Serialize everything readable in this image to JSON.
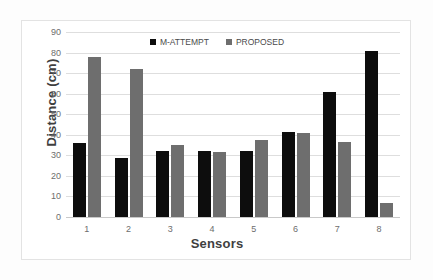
{
  "chart_data": {
    "type": "bar",
    "title": "",
    "xlabel": "Sensors",
    "ylabel": "Distance (cm)",
    "categories": [
      "1",
      "2",
      "3",
      "4",
      "5",
      "6",
      "7",
      "8"
    ],
    "series": [
      {
        "name": "M-ATTEMPT",
        "color": "#0d0d0d",
        "values": [
          36,
          28.5,
          32,
          32,
          32,
          41.5,
          61,
          81
        ]
      },
      {
        "name": "PROPOSED",
        "color": "#6e6e6e",
        "values": [
          78,
          72,
          35,
          31.5,
          37.5,
          41,
          36.5,
          7
        ]
      }
    ],
    "ylim": [
      0,
      90
    ],
    "yticks": [
      0,
      10,
      20,
      30,
      40,
      50,
      60,
      70,
      80,
      90
    ],
    "ytick_labels": [
      "0",
      "10",
      "20",
      "30",
      "40",
      "50",
      "60",
      "70",
      "80",
      "90"
    ],
    "grid": true,
    "legend_position": "top-center"
  }
}
